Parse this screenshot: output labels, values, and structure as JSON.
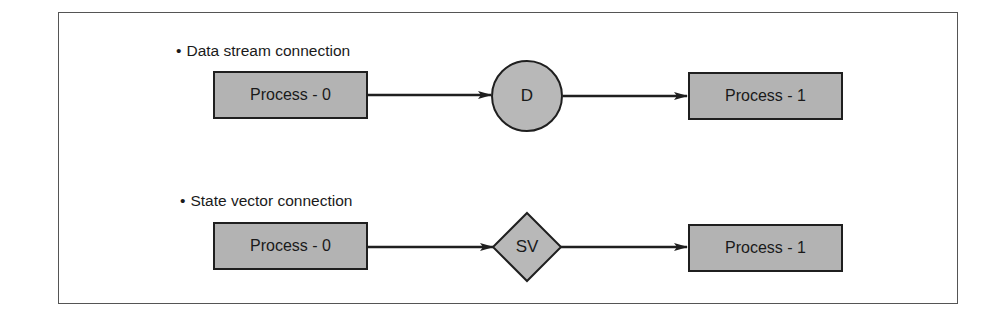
{
  "diagram": {
    "sections": [
      {
        "label": "Data stream connection",
        "bullet": "•",
        "source": "Process - 0",
        "connector": {
          "shape": "circle",
          "label": "D"
        },
        "target": "Process - 1"
      },
      {
        "label": "State vector connection",
        "bullet": "•",
        "source": "Process - 0",
        "connector": {
          "shape": "diamond",
          "label": "SV"
        },
        "target": "Process - 1"
      }
    ],
    "colors": {
      "box_fill": "#b3b3b3",
      "connector_fill": "#b8b8b8",
      "stroke": "#1f1f1f",
      "frame": "#555555"
    }
  }
}
